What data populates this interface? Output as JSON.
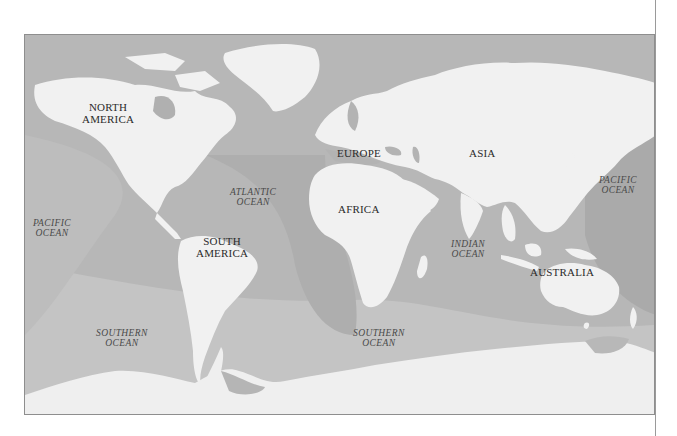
{
  "header": {
    "cut_off_text": "· ·"
  },
  "map": {
    "type": "world-physical-map",
    "colors": {
      "land": "#f1f1f1",
      "ocean_dark": "#a9a9a9",
      "ocean_mid": "#b9b9b9",
      "ocean_light": "#c6c6c6",
      "frame": "#8e8e8e",
      "label_dark": "#2b2b2b"
    },
    "continents": [
      {
        "id": "north-america",
        "line1": "NORTH",
        "line2": "AMERICA"
      },
      {
        "id": "south-america",
        "line1": "SOUTH",
        "line2": "AMERICA"
      },
      {
        "id": "europe",
        "line1": "EUROPE"
      },
      {
        "id": "asia",
        "line1": "ASIA"
      },
      {
        "id": "africa",
        "line1": "AFRICA"
      },
      {
        "id": "australia",
        "line1": "AUSTRALIA"
      }
    ],
    "oceans": [
      {
        "id": "pacific-west",
        "line1": "PACIFIC",
        "line2": "OCEAN"
      },
      {
        "id": "atlantic",
        "line1": "ATLANTIC",
        "line2": "OCEAN"
      },
      {
        "id": "indian",
        "line1": "INDIAN",
        "line2": "OCEAN"
      },
      {
        "id": "pacific-east",
        "line1": "PACIFIC",
        "line2": "OCEAN"
      },
      {
        "id": "southern-west",
        "line1": "SOUTHERN",
        "line2": "OCEAN"
      },
      {
        "id": "southern-east",
        "line1": "SOUTHERN",
        "line2": "OCEAN"
      }
    ]
  }
}
